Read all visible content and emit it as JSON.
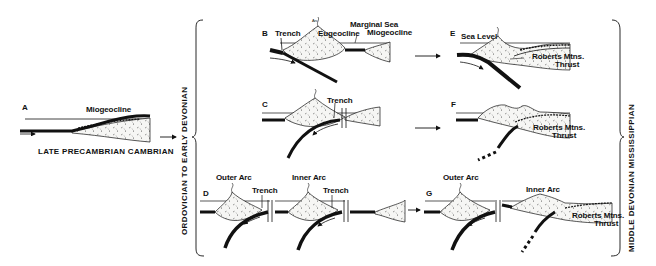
{
  "figure": {
    "periods": {
      "left": "LATE PRECAMBRIAN CAMBRIAN",
      "middle": "ORDOVICIAN TO EARLY DEVONIAN",
      "right": "MIDDLE DEVONIAN MISSISSIPPIAN"
    },
    "panels": {
      "A": {
        "letter": "A",
        "labels": {
          "miogeocline": "Miogeocline"
        }
      },
      "B": {
        "letter": "B",
        "labels": {
          "arc": "Arc",
          "trench": "Trench",
          "eugeocline": "Eugeocline",
          "marginal_sea": "Marginal Sea",
          "miogeocline": "Miogeocline"
        }
      },
      "C": {
        "letter": "C",
        "labels": {
          "trench": "Trench"
        }
      },
      "D": {
        "letter": "D",
        "labels": {
          "outer_arc": "Outer Arc",
          "trench_1": "Trench",
          "inner_arc": "Inner Arc",
          "trench_2": "Trench"
        }
      },
      "E": {
        "letter": "E",
        "labels": {
          "sea_level": "Sea Level",
          "thrust_1": "Roberts Mtns.",
          "thrust_2": "Thrust"
        }
      },
      "F": {
        "letter": "F",
        "labels": {
          "thrust_1": "Roberts Mtns.",
          "thrust_2": "Thrust"
        }
      },
      "G": {
        "letter": "G",
        "labels": {
          "outer_arc": "Outer Arc",
          "inner_arc": "Inner Arc",
          "thrust_1": "Roberts Mtns.",
          "thrust_2": "Thrust"
        }
      }
    },
    "colors": {
      "ink": "#111111",
      "background": "#ffffff",
      "sediment_fill": "#f4f4f2"
    }
  }
}
